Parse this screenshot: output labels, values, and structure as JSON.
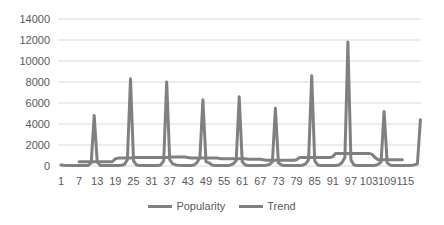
{
  "chart_data": {
    "type": "line",
    "title": "",
    "xlabel": "",
    "ylabel": "",
    "ylim": [
      0,
      14000
    ],
    "yticks": [
      0,
      2000,
      4000,
      6000,
      8000,
      10000,
      12000,
      14000
    ],
    "xtick_labels": [
      "1",
      "7",
      "13",
      "19",
      "25",
      "31",
      "37",
      "43",
      "49",
      "55",
      "61",
      "67",
      "73",
      "79",
      "85",
      "91",
      "97",
      "103",
      "109",
      "115"
    ],
    "grid": true,
    "legend_position": "bottom",
    "x": [
      1,
      2,
      3,
      4,
      5,
      6,
      7,
      8,
      9,
      10,
      11,
      12,
      13,
      14,
      15,
      16,
      17,
      18,
      19,
      20,
      21,
      22,
      23,
      24,
      25,
      26,
      27,
      28,
      29,
      30,
      31,
      32,
      33,
      34,
      35,
      36,
      37,
      38,
      39,
      40,
      41,
      42,
      43,
      44,
      45,
      46,
      47,
      48,
      49,
      50,
      51,
      52,
      53,
      54,
      55,
      56,
      57,
      58,
      59,
      60,
      61,
      62,
      63,
      64,
      65,
      66,
      67,
      68,
      69,
      70,
      71,
      72,
      73,
      74,
      75,
      76,
      77,
      78,
      79,
      80,
      81,
      82,
      83,
      84,
      85,
      86,
      87,
      88,
      89,
      90,
      91,
      92,
      93,
      94,
      95,
      96,
      97,
      98,
      99,
      100,
      101,
      102,
      103,
      104,
      105,
      106,
      107,
      108,
      109,
      110,
      111,
      112,
      113,
      114,
      115,
      116,
      117,
      118,
      119,
      120
    ],
    "series": [
      {
        "name": "Popularity",
        "color": "#808080",
        "values": [
          100,
          80,
          60,
          50,
          50,
          50,
          50,
          50,
          50,
          60,
          300,
          4800,
          400,
          60,
          50,
          50,
          50,
          50,
          50,
          60,
          80,
          150,
          600,
          8300,
          500,
          100,
          60,
          50,
          50,
          50,
          50,
          50,
          60,
          100,
          500,
          8000,
          600,
          200,
          100,
          80,
          60,
          50,
          50,
          60,
          100,
          300,
          800,
          6300,
          400,
          300,
          100,
          60,
          50,
          50,
          50,
          60,
          80,
          200,
          500,
          6600,
          400,
          100,
          60,
          50,
          50,
          50,
          50,
          60,
          80,
          150,
          400,
          5500,
          300,
          100,
          60,
          50,
          50,
          50,
          50,
          60,
          80,
          200,
          600,
          8600,
          500,
          100,
          60,
          50,
          50,
          50,
          50,
          60,
          100,
          300,
          800,
          11800,
          600,
          100,
          60,
          50,
          50,
          50,
          50,
          60,
          80,
          150,
          400,
          5200,
          300,
          80,
          50,
          50,
          50,
          50,
          50,
          60,
          80,
          100,
          200,
          4400
        ]
      },
      {
        "name": "Trend",
        "color": "#808080",
        "values": [
          null,
          null,
          null,
          null,
          null,
          null,
          400,
          400,
          400,
          400,
          400,
          400,
          400,
          400,
          400,
          400,
          400,
          400,
          700,
          750,
          750,
          750,
          750,
          750,
          800,
          800,
          800,
          800,
          800,
          800,
          800,
          800,
          800,
          800,
          800,
          800,
          850,
          850,
          850,
          850,
          850,
          850,
          800,
          750,
          750,
          750,
          750,
          750,
          750,
          750,
          750,
          750,
          750,
          700,
          700,
          700,
          700,
          700,
          700,
          700,
          700,
          700,
          650,
          650,
          650,
          650,
          650,
          600,
          550,
          550,
          550,
          550,
          550,
          550,
          550,
          550,
          550,
          550,
          600,
          800,
          800,
          800,
          800,
          800,
          800,
          800,
          800,
          800,
          800,
          800,
          900,
          1200,
          1200,
          1200,
          1200,
          1200,
          1200,
          1200,
          1200,
          1200,
          1200,
          1200,
          1200,
          1100,
          800,
          600,
          600,
          600,
          600,
          600,
          600,
          600,
          600,
          600,
          null,
          null,
          null,
          null,
          null,
          null
        ]
      }
    ]
  },
  "legend": {
    "items": [
      {
        "label": "Popularity"
      },
      {
        "label": "Trend"
      }
    ]
  }
}
